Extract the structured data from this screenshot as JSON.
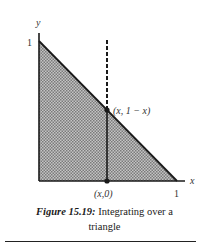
{
  "figure": {
    "axes": {
      "x_label": "x",
      "y_label": "y",
      "x_tick_label": "1",
      "y_tick_label": "1"
    },
    "region": {
      "shape": "triangle",
      "vertices": [
        [
          0,
          0
        ],
        [
          1,
          0
        ],
        [
          0,
          1
        ]
      ],
      "fill_color": "#a9a9a9",
      "edge_color": "#1a1a1a"
    },
    "vertical_line": {
      "style_above_hypotenuse": "dashed",
      "style_below_hypotenuse": "solid"
    },
    "points": [
      {
        "label": "(x, 1 − x)"
      },
      {
        "label": "(x,0)"
      }
    ]
  },
  "caption": {
    "label": "Figure 15.19:",
    "text_line1": " Integrating over a",
    "text_line2": "triangle"
  }
}
